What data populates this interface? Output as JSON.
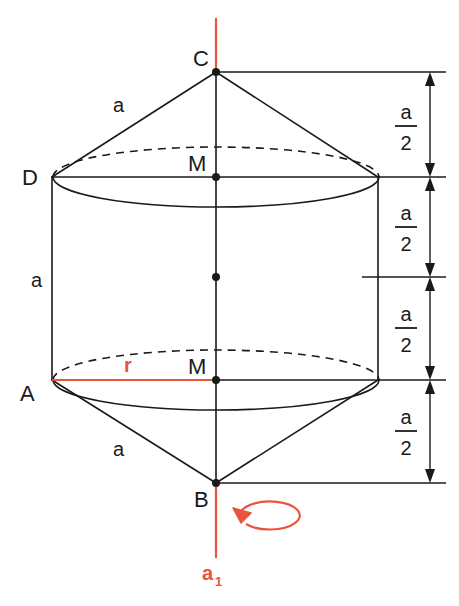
{
  "figure": {
    "background_color": "#ffffff",
    "line_color": "#1a1a1a",
    "accent_color": "#e8553c"
  },
  "vertices": [
    {
      "id": "C",
      "label": "C",
      "x": 216,
      "y": 72,
      "label_x": 193,
      "label_y": 66
    },
    {
      "id": "D",
      "label": "D",
      "x": 52,
      "y": 177,
      "label_x": 28,
      "label_y": 184
    },
    {
      "id": "M_top",
      "label": "M",
      "x": 216,
      "y": 177,
      "label_x": 190,
      "label_y": 170
    },
    {
      "id": "M_mid",
      "label": "",
      "x": 216,
      "y": 277,
      "label_x": 0,
      "label_y": 0
    },
    {
      "id": "A",
      "label": "A",
      "x": 52,
      "y": 380,
      "label_x": 26,
      "label_y": 400
    },
    {
      "id": "M_bot",
      "label": "M",
      "x": 216,
      "y": 380,
      "label_x": 190,
      "label_y": 373
    },
    {
      "id": "B",
      "label": "B",
      "x": 216,
      "y": 483,
      "label_x": 196,
      "label_y": 505
    }
  ],
  "edge_labels": [
    {
      "id": "a-top-cone",
      "text": "a",
      "x": 120,
      "y": 112
    },
    {
      "id": "a-cylinder",
      "text": "a",
      "x": 32,
      "y": 286
    },
    {
      "id": "a-bottom-cone",
      "text": "a",
      "x": 120,
      "y": 455
    }
  ],
  "radius_label": {
    "text": "r",
    "x": 128,
    "y": 371,
    "color": "#e8553c"
  },
  "axis_label": {
    "text": "a",
    "subscript": "1",
    "x": 205,
    "y": 578,
    "color": "#e8553c"
  },
  "dimensions": {
    "numerator": "a",
    "denominator": "2",
    "segments": [
      {
        "id": "dim-1",
        "top": 72,
        "bottom": 177,
        "label_numerator": "a",
        "label_denominator": "2"
      },
      {
        "id": "dim-2",
        "top": 177,
        "bottom": 277,
        "label_numerator": "a",
        "label_denominator": "2"
      },
      {
        "id": "dim-3",
        "top": 277,
        "bottom": 380,
        "label_numerator": "a",
        "label_denominator": "2"
      },
      {
        "id": "dim-4",
        "top": 380,
        "bottom": 483,
        "label_numerator": "a",
        "label_denominator": "2"
      }
    ]
  },
  "geometry": {
    "cylinder_left_x": 52,
    "cylinder_right_x": 378,
    "center_x": 216,
    "ellipse_rx": 163,
    "ellipse_ry": 30,
    "top_ellipse_y": 177,
    "bottom_ellipse_y": 380,
    "apex_top_y": 72,
    "apex_bottom_y": 483,
    "axis_top_y": 18,
    "axis_bottom_y": 558,
    "dim_line_x": 430,
    "dim_ext_right_x": 446
  }
}
